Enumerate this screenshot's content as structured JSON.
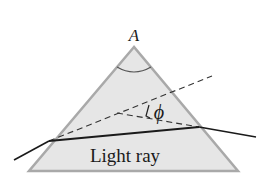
{
  "diagram": {
    "apex_label": "A",
    "angle_label": "ϕ",
    "ray_label": "Light ray",
    "colors": {
      "prism_fill": "#e6e6e6",
      "prism_stroke": "#a9a9a9",
      "ray": "#1a1a1a",
      "dashed": "#333333",
      "text": "#1a1a1a"
    }
  }
}
